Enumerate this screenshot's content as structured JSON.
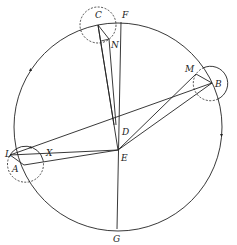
{
  "diagram": {
    "type": "geometric construction",
    "colors": {
      "stroke": "#222222",
      "background": "#ffffff"
    },
    "labels": {
      "A": "A",
      "B": "B",
      "C": "C",
      "D": "D",
      "E": "E",
      "F": "F",
      "G": "G",
      "L": "L",
      "M": "M",
      "N": "N",
      "X": "X"
    },
    "main_circle": {
      "center": [
        118,
        127
      ],
      "radius": 104
    },
    "small_circles": [
      {
        "name": "circle-at-C",
        "center": [
          98,
          25
        ],
        "radius": 18,
        "style": "dashed"
      },
      {
        "name": "circle-at-B",
        "center": [
          211,
          83
        ],
        "radius": 17,
        "style": "solid with dashed inner arc"
      },
      {
        "name": "circle-at-A",
        "center": [
          25,
          162
        ],
        "radius": 18,
        "style": "dashed with solid upper arc"
      }
    ],
    "points": {
      "A": [
        24,
        165
      ],
      "B": [
        212,
        83
      ],
      "C": [
        98,
        25
      ],
      "D": [
        116,
        125
      ],
      "E": [
        118,
        150
      ],
      "F": [
        121,
        22
      ],
      "G": [
        117,
        229
      ],
      "L": [
        10,
        155
      ],
      "M": [
        196,
        74
      ],
      "N": [
        109,
        40
      ],
      "X": [
        46,
        155
      ]
    },
    "segments": [
      [
        "F",
        "G"
      ],
      [
        "C",
        "E"
      ],
      [
        "C",
        "D"
      ],
      [
        "C",
        "N"
      ],
      [
        "N",
        "D"
      ],
      [
        "B",
        "D"
      ],
      [
        "B",
        "E"
      ],
      [
        "M",
        "E"
      ],
      [
        "M",
        "B"
      ],
      [
        "L",
        "D"
      ],
      [
        "L",
        "E"
      ],
      [
        "A",
        "E"
      ],
      [
        "L",
        "A"
      ]
    ],
    "direction_arrows": 3
  }
}
